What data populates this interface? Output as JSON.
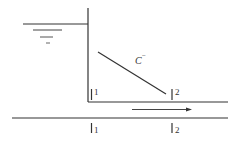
{
  "diagram": {
    "type": "hydraulic-channel-sketch",
    "colors": {
      "line": "#333333",
      "background": "#ffffff"
    },
    "curve_label": "C",
    "curve_label_sup": "−",
    "upper_sections": [
      {
        "id": "1",
        "label": "1"
      },
      {
        "id": "2",
        "label": "2"
      }
    ],
    "lower_sections": [
      {
        "id": "1",
        "label": "1"
      },
      {
        "id": "2",
        "label": "2"
      }
    ],
    "flow_direction": "right"
  }
}
